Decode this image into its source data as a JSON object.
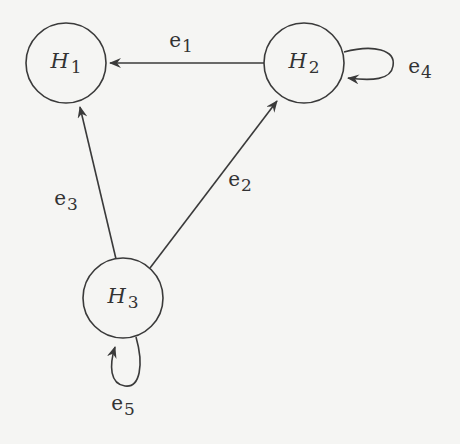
{
  "diagram": {
    "type": "directed-graph",
    "colors": {
      "stroke": "#3a3a3a",
      "text": "#333333",
      "background": "#f5f5f3"
    },
    "nodes": [
      {
        "id": "H1",
        "symbol": "H",
        "sub": "1",
        "cx": 66,
        "cy": 63,
        "r": 40
      },
      {
        "id": "H2",
        "symbol": "H",
        "sub": "2",
        "cx": 304,
        "cy": 63,
        "r": 40
      },
      {
        "id": "H3",
        "symbol": "H",
        "sub": "3",
        "cx": 123,
        "cy": 298,
        "r": 40
      }
    ],
    "edges": [
      {
        "id": "e1",
        "symbol": "e",
        "sub": "1",
        "from": "H2",
        "to": "H1",
        "label_x": 181,
        "label_y": 42
      },
      {
        "id": "e2",
        "symbol": "e",
        "sub": "2",
        "from": "H3",
        "to": "H2",
        "label_x": 240,
        "label_y": 181
      },
      {
        "id": "e3",
        "symbol": "e",
        "sub": "3",
        "from": "H3",
        "to": "H1",
        "label_x": 66,
        "label_y": 200
      },
      {
        "id": "e4",
        "symbol": "e",
        "sub": "4",
        "from": "H2",
        "to": "H2",
        "label_x": 420,
        "label_y": 68
      },
      {
        "id": "e5",
        "symbol": "e",
        "sub": "5",
        "from": "H3",
        "to": "H3",
        "label_x": 123,
        "label_y": 405
      }
    ]
  }
}
